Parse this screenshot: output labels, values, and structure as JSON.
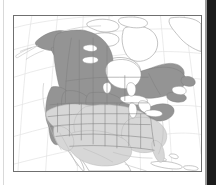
{
  "figure": {
    "type": "distribution-map",
    "region": "North America",
    "rendering": "grayscale line map with shaded range polygons",
    "frame": {
      "visible": true,
      "border_color": "#6f6f6f"
    },
    "background_color": "#ffffff",
    "artifacts": {
      "right_edge_band_color": "#1b1b1b",
      "left_edge_rule_color": "#d9d9d9"
    }
  },
  "legend_shading": {
    "dark_fill": "#949494",
    "dark_meaning": "core / breeding range",
    "light_fill": "#d7d7d7",
    "light_meaning": "secondary / wintering range",
    "unshaded_fill": "#ffffff",
    "unshaded_meaning": "outside range"
  },
  "map_features": {
    "graticule": {
      "visible": true,
      "color": "#e2e2e2",
      "projection": "conic"
    },
    "coastline_color": "#9a9a9a",
    "boundary_color": "#7f7f7f",
    "lakes": [
      "Great Lakes",
      "Great Bear Lake",
      "Great Slave Lake",
      "Lake Winnipeg"
    ],
    "landmasses": [
      "Alaska",
      "Aleutian Islands",
      "Canada",
      "Canadian Arctic Archipelago",
      "Greenland edge",
      "Newfoundland",
      "Contiguous United States",
      "Mexico",
      "Baja California",
      "Cuba",
      "Hispaniola",
      "Bahamas",
      "Central America"
    ]
  },
  "shaded_regions": {
    "dark": [
      "Alaska",
      "Yukon",
      "Northwest Territories",
      "Nunavut mainland",
      "British Columbia",
      "Alberta",
      "Saskatchewan",
      "Manitoba",
      "Ontario",
      "Quebec",
      "Labrador",
      "Newfoundland",
      "Maritimes",
      "Northern Rocky Mountains",
      "Pacific Northwest",
      "Sierra Nevada",
      "Northern Great Plains",
      "Great Lakes states",
      "New England"
    ],
    "light": [
      "Great Basin",
      "Central Plains",
      "Midwest",
      "Southeast United States",
      "Texas",
      "Southwest United States",
      "Northern Mexico highlands"
    ],
    "unshaded": [
      "Canadian Arctic Archipelago",
      "Greenland",
      "Southern Mexico",
      "Baja California",
      "Caribbean islands",
      "Central America"
    ]
  }
}
